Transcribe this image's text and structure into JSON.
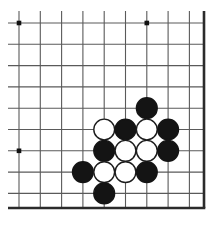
{
  "figure": {
    "kind": "go-board-diagram",
    "width": 216,
    "height": 229,
    "background_color": "#ffffff"
  },
  "board": {
    "grid_color": "#5a5a5a",
    "edge_color": "#2b2b2b",
    "grid_line_width": 1.1,
    "edge_line_width": 2.6,
    "origin_x": 19,
    "origin_y": 23,
    "spacing": 21.3,
    "columns": 9,
    "rows": 9,
    "x_lines": [
      19,
      40.3,
      61.6,
      82.9,
      104.2,
      125.5,
      146.8,
      168.1,
      189.4
    ],
    "y_lines": [
      23,
      44.3,
      65.6,
      86.9,
      108.2,
      129.5,
      150.8,
      172.1,
      193.4
    ],
    "left_open_extent": 8,
    "top_open_extent": 11,
    "right_edge_x": 204,
    "bottom_edge_y": 208,
    "right_edge_is_border": true,
    "bottom_edge_is_border": true,
    "left_edge_is_border": false,
    "top_edge_is_border": false
  },
  "star_points": {
    "color": "#111111",
    "radius": 2.3,
    "points": [
      {
        "col": 0,
        "row": 0
      },
      {
        "col": 6,
        "row": 0
      },
      {
        "col": 0,
        "row": 6
      }
    ]
  },
  "stones": {
    "radius": 10.4,
    "black_fill": "#141414",
    "black_stroke": "#141414",
    "white_fill": "#ffffff",
    "white_stroke": "#1c1c1c",
    "stroke_width": 1.4,
    "black_count": 8,
    "white_count": 6,
    "total_count": 14,
    "list": [
      {
        "color": "black",
        "col": 6,
        "row": 4,
        "label": "b1"
      },
      {
        "color": "white",
        "col": 4,
        "row": 5,
        "label": "w1"
      },
      {
        "color": "black",
        "col": 5,
        "row": 5,
        "label": "b2"
      },
      {
        "color": "white",
        "col": 6,
        "row": 5,
        "label": "w2"
      },
      {
        "color": "black",
        "col": 7,
        "row": 5,
        "label": "b3"
      },
      {
        "color": "black",
        "col": 4,
        "row": 6,
        "label": "b4"
      },
      {
        "color": "white",
        "col": 5,
        "row": 6,
        "label": "w3"
      },
      {
        "color": "white",
        "col": 6,
        "row": 6,
        "label": "w4"
      },
      {
        "color": "black",
        "col": 7,
        "row": 6,
        "label": "b5"
      },
      {
        "color": "black",
        "col": 3,
        "row": 7,
        "label": "b6"
      },
      {
        "color": "white",
        "col": 4,
        "row": 7,
        "label": "w5"
      },
      {
        "color": "white",
        "col": 5,
        "row": 7,
        "label": "w6"
      },
      {
        "color": "black",
        "col": 6,
        "row": 7,
        "label": "b7"
      },
      {
        "color": "black",
        "col": 4,
        "row": 8,
        "label": "b8"
      }
    ]
  }
}
